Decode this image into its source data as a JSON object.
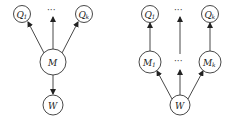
{
  "diagrams": [
    {
      "name": "single-mediator",
      "nodes": {
        "q1": {
          "label": "Q",
          "sub": "1"
        },
        "dots_top": {
          "label": "···"
        },
        "qk": {
          "label": "Q",
          "sub": "k"
        },
        "m": {
          "label": "M"
        },
        "w": {
          "label": "W"
        }
      },
      "edges": [
        {
          "from": "M",
          "to": "Q1"
        },
        {
          "from": "M",
          "to": "..."
        },
        {
          "from": "M",
          "to": "Qk"
        },
        {
          "from": "M",
          "to": "W"
        }
      ]
    },
    {
      "name": "multiple-mediators",
      "nodes": {
        "q1": {
          "label": "Q",
          "sub": "1"
        },
        "dots_top": {
          "label": "···"
        },
        "qk": {
          "label": "Q",
          "sub": "k"
        },
        "m1": {
          "label": "M",
          "sub": "1"
        },
        "dots_mid": {
          "label": "···"
        },
        "mk": {
          "label": "M",
          "sub": "k"
        },
        "w": {
          "label": "W"
        }
      },
      "edges": [
        {
          "from": "W",
          "to": "M1"
        },
        {
          "from": "W",
          "to": "..."
        },
        {
          "from": "W",
          "to": "Mk"
        },
        {
          "from": "M1",
          "to": "Q1"
        },
        {
          "from": "...",
          "to": "..."
        },
        {
          "from": "Mk",
          "to": "Qk"
        }
      ]
    }
  ]
}
